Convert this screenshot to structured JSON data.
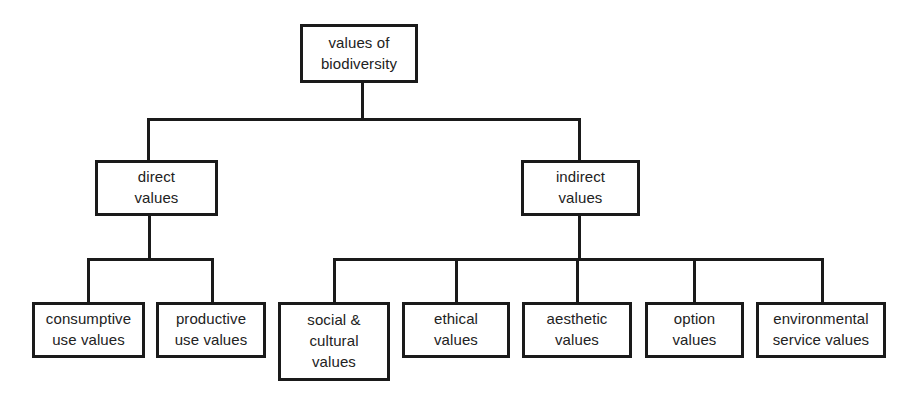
{
  "diagram": {
    "type": "hierarchy-tree",
    "title": "values of biodiversity",
    "background_color": "#ffffff",
    "line_color": "#1a1a1a",
    "text_color": "#222222",
    "levels": 3,
    "root": {
      "id": "root",
      "label": "values of\nbiodiversity"
    },
    "branches": [
      {
        "id": "direct",
        "label": "direct\nvalues",
        "children": [
          {
            "id": "consumptive-use-values",
            "label": "consumptive\nuse values"
          },
          {
            "id": "productive-use-values",
            "label": "productive\nuse values"
          }
        ]
      },
      {
        "id": "indirect",
        "label": "indirect\nvalues",
        "children": [
          {
            "id": "social-cultural-values",
            "label": "social &\ncultural\nvalues"
          },
          {
            "id": "ethical-values",
            "label": "ethical\nvalues"
          },
          {
            "id": "aesthetic-values",
            "label": "aesthetic\nvalues"
          },
          {
            "id": "option-values",
            "label": "option\nvalues"
          },
          {
            "id": "environmental-service-values",
            "label": "environmental\nservice values"
          }
        ]
      }
    ]
  }
}
